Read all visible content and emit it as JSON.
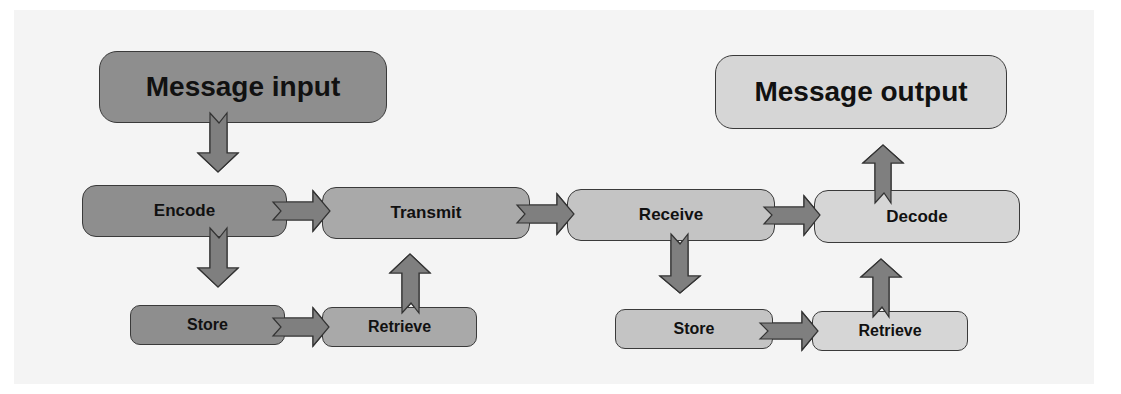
{
  "diagram": {
    "nodes": {
      "message_input": "Message input",
      "message_output": "Message output",
      "encode": "Encode",
      "transmit": "Transmit",
      "receive": "Receive",
      "decode": "Decode",
      "store_sender": "Store",
      "retrieve_sender": "Retrieve",
      "store_receiver": "Store",
      "retrieve_receiver": "Retrieve"
    },
    "edges": [
      {
        "from": "Message input",
        "to": "Encode"
      },
      {
        "from": "Encode",
        "to": "Transmit"
      },
      {
        "from": "Encode",
        "to": "Store"
      },
      {
        "from": "Store",
        "to": "Retrieve"
      },
      {
        "from": "Retrieve",
        "to": "Transmit"
      },
      {
        "from": "Transmit",
        "to": "Receive"
      },
      {
        "from": "Receive",
        "to": "Decode"
      },
      {
        "from": "Receive",
        "to": "Store"
      },
      {
        "from": "Store",
        "to": "Retrieve"
      },
      {
        "from": "Retrieve",
        "to": "Decode"
      },
      {
        "from": "Decode",
        "to": "Message output"
      }
    ],
    "colors": {
      "panel_background": "#f4f4f4",
      "node_dark": "#8e8e8e",
      "node_mid": "#a9a9a9",
      "node_light": "#c4c4c4",
      "node_lighter": "#d6d6d6",
      "arrow_fill": "#7f7f7f",
      "outline": "#3a3a3a"
    }
  }
}
